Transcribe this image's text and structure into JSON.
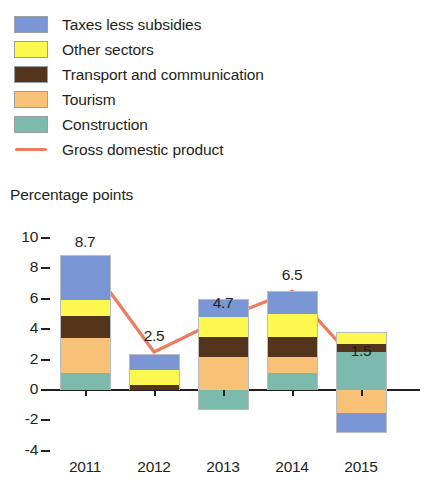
{
  "legend": {
    "items": [
      {
        "label": "Taxes less subsidies",
        "color": "#7B96D4",
        "marker": "swatch"
      },
      {
        "label": "Other sectors",
        "color": "#FDF84F",
        "marker": "swatch"
      },
      {
        "label": "Transport and communication",
        "color": "#54351C",
        "marker": "swatch"
      },
      {
        "label": "Tourism",
        "color": "#F7C277",
        "marker": "swatch"
      },
      {
        "label": "Construction",
        "color": "#7CBAAE",
        "marker": "swatch"
      },
      {
        "label": "Gross domestic product",
        "color": "#EE7B5F",
        "marker": "line"
      }
    ]
  },
  "axis": {
    "y_title": "Percentage points",
    "y_ticks": [
      "10",
      "8",
      "6",
      "4",
      "2",
      "0",
      "-2",
      "-4"
    ],
    "x_labels": [
      "2011",
      "2012",
      "2013",
      "2014",
      "2015"
    ]
  },
  "chart_data": {
    "type": "bar",
    "title": "",
    "subtitle": "",
    "xlabel": "",
    "ylabel": "Percentage points",
    "ylim": [
      -4,
      10
    ],
    "yticks": [
      10,
      8,
      6,
      4,
      2,
      0,
      -2,
      -4
    ],
    "grid": false,
    "stacked": true,
    "legend_position": "top-left",
    "categories": [
      "2011",
      "2012",
      "2013",
      "2014",
      "2015"
    ],
    "series": [
      {
        "name": "Construction",
        "color": "#7CBAAE",
        "values": [
          1.1,
          0.0,
          -1.3,
          1.1,
          2.5
        ]
      },
      {
        "name": "Tourism",
        "color": "#F7C277",
        "values": [
          2.3,
          0.0,
          2.2,
          1.1,
          -1.5
        ]
      },
      {
        "name": "Transport and communication",
        "color": "#54351C",
        "values": [
          1.5,
          0.3,
          1.3,
          1.3,
          0.5
        ]
      },
      {
        "name": "Other sectors",
        "color": "#FDF84F",
        "values": [
          1.0,
          1.0,
          1.3,
          1.5,
          0.8
        ]
      },
      {
        "name": "Taxes less subsidies",
        "color": "#7B96D4",
        "values": [
          3.0,
          1.1,
          1.2,
          1.5,
          -1.3
        ]
      }
    ],
    "line_series": {
      "name": "Gross domestic product",
      "color": "#EE7B5F",
      "values": [
        8.7,
        2.5,
        4.7,
        6.5,
        1.5
      ]
    },
    "data_labels": [
      "8.7",
      "2.5",
      "4.7",
      "6.5",
      "1.5"
    ]
  }
}
